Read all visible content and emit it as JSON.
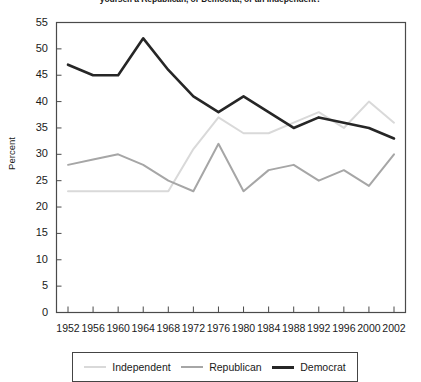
{
  "chart_data": {
    "type": "line",
    "title": "yourself a Republican, or Democrat, or an Independent?",
    "xlabel": "",
    "ylabel": "Percent",
    "ylim": [
      0,
      55
    ],
    "ytick_step": 5,
    "grid": false,
    "legend_position": "bottom",
    "categories": [
      "1952",
      "1956",
      "1960",
      "1964",
      "1968",
      "1972",
      "1976",
      "1980",
      "1984",
      "1988",
      "1992",
      "1996",
      "2000",
      "2002"
    ],
    "series": [
      {
        "name": "Independent",
        "color": "#d9d9d9",
        "values": [
          23,
          23,
          23,
          23,
          23,
          31,
          37,
          34,
          34,
          36,
          38,
          35,
          40,
          36
        ]
      },
      {
        "name": "Republican",
        "color": "#a6a6a6",
        "values": [
          28,
          29,
          30,
          28,
          25,
          23,
          32,
          23,
          27,
          28,
          25,
          27,
          24,
          30
        ]
      },
      {
        "name": "Democrat",
        "color": "#262626",
        "values": [
          47,
          45,
          45,
          52,
          46,
          41,
          38,
          41,
          38,
          35,
          37,
          36,
          35,
          33
        ]
      }
    ],
    "ytick_labels": [
      "0",
      "5",
      "10",
      "15",
      "20",
      "25",
      "30",
      "35",
      "40",
      "45",
      "50",
      "55"
    ]
  },
  "legend": {
    "items": [
      {
        "label": "Independent"
      },
      {
        "label": "Republican"
      },
      {
        "label": "Democrat"
      }
    ]
  }
}
